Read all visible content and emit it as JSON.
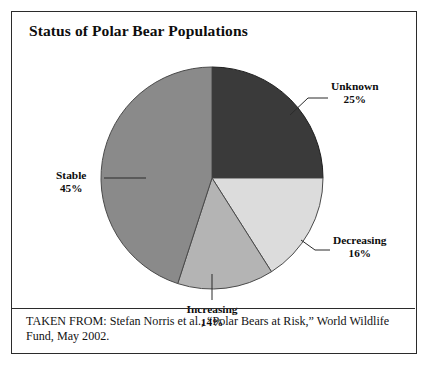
{
  "figure": {
    "title": "Status of Polar Bear Populations",
    "caption": "TAKEN FROM: Stefan Norris et al., “Polar Bears at Risk,” World Wildlife Fund, May 2002."
  },
  "chart_data": {
    "type": "pie",
    "title": "Status of Polar Bear Populations",
    "categories": [
      "Unknown",
      "Decreasing",
      "Increasing",
      "Stable"
    ],
    "values": [
      25,
      16,
      14,
      45
    ],
    "unit": "percent",
    "start_angle_deg": 0,
    "direction": "clockwise",
    "legend": "none",
    "labels_placement": "outside-with-leader-lines",
    "slices": [
      {
        "name": "Unknown",
        "value": 25,
        "value_label": "25%",
        "color": "#3a3a3a",
        "start_deg": 0,
        "end_deg": 90
      },
      {
        "name": "Decreasing",
        "value": 16,
        "value_label": "16%",
        "color": "#dcdcdc",
        "start_deg": 90,
        "end_deg": 147.6
      },
      {
        "name": "Increasing",
        "value": 14,
        "value_label": "14%",
        "color": "#b4b4b4",
        "start_deg": 147.6,
        "end_deg": 198
      },
      {
        "name": "Stable",
        "value": 45,
        "value_label": "45%",
        "color": "#8a8a8a",
        "start_deg": 198,
        "end_deg": 360
      }
    ]
  },
  "labels": {
    "unknown": {
      "name": "Unknown",
      "pct": "25%"
    },
    "decreasing": {
      "name": "Decreasing",
      "pct": "16%"
    },
    "increasing": {
      "name": "Increasing",
      "pct": "14%"
    },
    "stable": {
      "name": "Stable",
      "pct": "45%"
    }
  }
}
